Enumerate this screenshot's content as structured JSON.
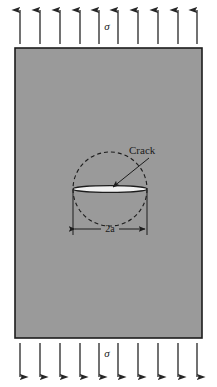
{
  "figure": {
    "width": 217,
    "height": 387
  },
  "colors": {
    "plate_fill": "#9a9a9a",
    "plate_stroke": "#1c1c1c",
    "arrow_stroke": "#262626",
    "crack_fill": "#f2f2f2",
    "crack_stroke": "#1c1c1c",
    "circle_stroke": "#1c1c1c",
    "text": "#1a1a1a",
    "background": "#ffffff"
  },
  "plate": {
    "x": 15,
    "y": 48,
    "width": 187,
    "height": 290,
    "stroke_width": 1.6
  },
  "load_top": {
    "label": "σ",
    "label_x": 107,
    "label_y": 30,
    "direction": "up",
    "count": 10,
    "y_tail": 44,
    "y_head": 10,
    "x_positions": [
      20,
      40,
      60,
      80,
      99,
      118,
      138,
      158,
      178,
      197
    ]
  },
  "load_bottom": {
    "label": "σ",
    "label_x": 107,
    "label_y": 357,
    "direction": "down",
    "count": 10,
    "y_tail": 343,
    "y_head": 377,
    "x_positions": [
      20,
      40,
      60,
      80,
      99,
      118,
      138,
      158,
      178,
      197
    ]
  },
  "crack": {
    "label": "Crack",
    "label_x": 129,
    "label_y": 154,
    "center_x": 110,
    "center_y": 189,
    "half_length": 37,
    "half_opening": 3.4,
    "leader": {
      "from_x": 149,
      "from_y": 158,
      "to_x": 113,
      "to_y": 187
    }
  },
  "process_zone_circle": {
    "center_x": 110,
    "center_y": 189,
    "radius": 37,
    "dash": "4 3",
    "style": "dashed"
  },
  "dimension": {
    "label": "2a",
    "label_x": 110,
    "label_y": 232,
    "line_y": 229,
    "left_x": 73,
    "right_x": 147,
    "extension_top_y": 190,
    "extension_bottom_y": 235
  }
}
